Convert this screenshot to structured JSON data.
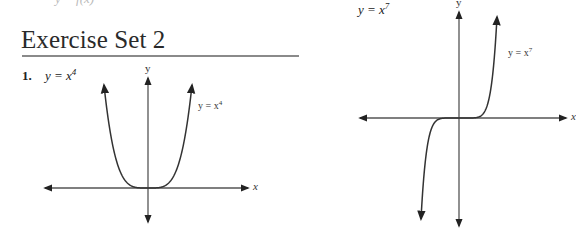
{
  "page": {
    "top_fragment": "y = f(x)",
    "heading": "Exercise Set 2",
    "exercises": [
      {
        "number": "1.",
        "equation_base": "y = x",
        "equation_exp": "4"
      },
      {
        "number": "",
        "equation_base": "y = x",
        "equation_exp": "7"
      }
    ]
  },
  "chart_data": [
    {
      "type": "line",
      "title": "y = x^4",
      "function": "x^4",
      "xlabel": "x",
      "ylabel": "y",
      "curve_label": "y = x^4",
      "x": [
        -1.0,
        -0.8,
        -0.6,
        -0.4,
        -0.2,
        0,
        0.2,
        0.4,
        0.6,
        0.8,
        1.0
      ],
      "values": [
        1.0,
        0.4096,
        0.1296,
        0.0256,
        0.0016,
        0,
        0.0016,
        0.0256,
        0.1296,
        0.4096,
        1.0
      ],
      "grid": false,
      "ticks": false,
      "axis_arrows": true
    },
    {
      "type": "line",
      "title": "y = x^7",
      "function": "x^7",
      "xlabel": "x",
      "ylabel": "y",
      "curve_label": "y = x^7",
      "x": [
        -1.0,
        -0.8,
        -0.6,
        -0.4,
        -0.2,
        0,
        0.2,
        0.4,
        0.6,
        0.8,
        1.0
      ],
      "values": [
        -1.0,
        -0.2097,
        -0.028,
        -0.0016,
        0.0,
        0,
        0.0,
        0.0016,
        0.028,
        0.2097,
        1.0
      ],
      "grid": false,
      "ticks": false,
      "axis_arrows": true
    }
  ],
  "graphs": [
    {
      "exp": 4,
      "origin": [
        148,
        188
      ],
      "scale": [
        44,
        103
      ],
      "x_axis": [
        45,
        248
      ],
      "y_axis": [
        78,
        222
      ],
      "xlabel": "x",
      "ylabel": "y",
      "curve_label_base": "y = x",
      "curve_label_exp": "4",
      "stroke": "#333333",
      "axis_stroke": "#555555"
    },
    {
      "exp": 7,
      "origin": [
        459,
        118
      ],
      "scale": [
        38,
        101
      ],
      "x_axis": [
        360,
        566
      ],
      "y_axis": [
        12,
        226
      ],
      "xlabel": "x",
      "ylabel": "y",
      "curve_label_base": "y = x",
      "curve_label_exp": "7",
      "stroke": "#333333",
      "axis_stroke": "#555555"
    }
  ]
}
